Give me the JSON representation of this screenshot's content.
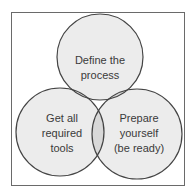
{
  "diagram": {
    "type": "venn",
    "colors": {
      "frame_border": "#6a6a6a",
      "circle_fill": "#ececec",
      "overlap_fill": "#d8d8d8",
      "circle_stroke": "#444444",
      "text": "#3a3a3a",
      "background": "#ffffff"
    },
    "circles": [
      {
        "id": "top",
        "lines": [
          "Define the",
          "process"
        ]
      },
      {
        "id": "left",
        "lines": [
          "Get all",
          "required",
          "tools"
        ]
      },
      {
        "id": "right",
        "lines": [
          "Prepare",
          "yourself",
          "(be ready)"
        ]
      }
    ]
  }
}
